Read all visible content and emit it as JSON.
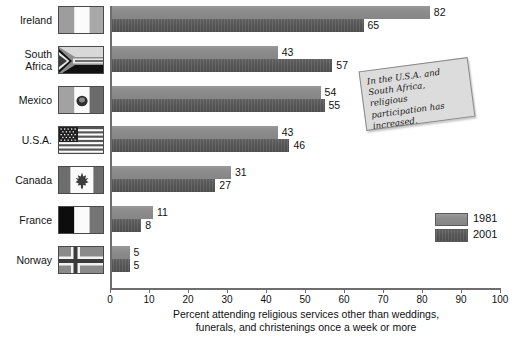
{
  "chart_data": {
    "type": "bar",
    "orientation": "horizontal",
    "title": "",
    "xlabel": "Percent attending religious services other than weddings, funerals, and christenings once a week or more",
    "xlabel_lines": [
      "Percent attending religious services other than weddings,",
      "funerals, and christenings once a week or more"
    ],
    "ylabel": "",
    "xlim": [
      0,
      100
    ],
    "xticks": [
      0,
      10,
      20,
      30,
      40,
      50,
      60,
      70,
      80,
      90,
      100
    ],
    "xtick_labels": [
      "0",
      "10",
      "20",
      "30",
      "40",
      "50",
      "60",
      "70",
      "80",
      "90",
      "100"
    ],
    "grid": false,
    "legend_position": "right",
    "categories": [
      "Ireland",
      "South Africa",
      "Mexico",
      "U.S.A.",
      "Canada",
      "France",
      "Norway"
    ],
    "series": [
      {
        "name": "1981",
        "color": "#8f8f8f",
        "values": [
          82,
          43,
          54,
          43,
          31,
          11,
          5
        ]
      },
      {
        "name": "2001",
        "color": "#5e5e5e",
        "values": [
          65,
          57,
          55,
          46,
          27,
          8,
          5
        ]
      }
    ],
    "annotations": [
      {
        "text": "In the U.S.A. and South Africa, religious participation has increased.",
        "kind": "callout-box"
      }
    ]
  },
  "rows": [
    {
      "label_lines": [
        "Ireland"
      ],
      "flag": "flag-ireland",
      "v1981": "82",
      "v2001": "65"
    },
    {
      "label_lines": [
        "South",
        "Africa"
      ],
      "flag": "flag-south-africa",
      "v1981": "43",
      "v2001": "57"
    },
    {
      "label_lines": [
        "Mexico"
      ],
      "flag": "flag-mexico",
      "v1981": "54",
      "v2001": "55"
    },
    {
      "label_lines": [
        "U.S.A."
      ],
      "flag": "flag-usa",
      "v1981": "43",
      "v2001": "46"
    },
    {
      "label_lines": [
        "Canada"
      ],
      "flag": "flag-canada",
      "v1981": "31",
      "v2001": "27"
    },
    {
      "label_lines": [
        "France"
      ],
      "flag": "flag-france",
      "v1981": "11",
      "v2001": "8"
    },
    {
      "label_lines": [
        "Norway"
      ],
      "flag": "flag-norway",
      "v1981": "5",
      "v2001": "5"
    }
  ],
  "legend": {
    "items": [
      {
        "label": "1981",
        "color": "#8f8f8f"
      },
      {
        "label": "2001",
        "color": "#5e5e5e"
      }
    ]
  },
  "callout": {
    "text": "In the U.S.A. and South Africa, religious participation has increased."
  },
  "axis": {
    "title_line1": "Percent attending religious services other than weddings,",
    "title_line2": "funerals, and christenings once a week or more"
  }
}
